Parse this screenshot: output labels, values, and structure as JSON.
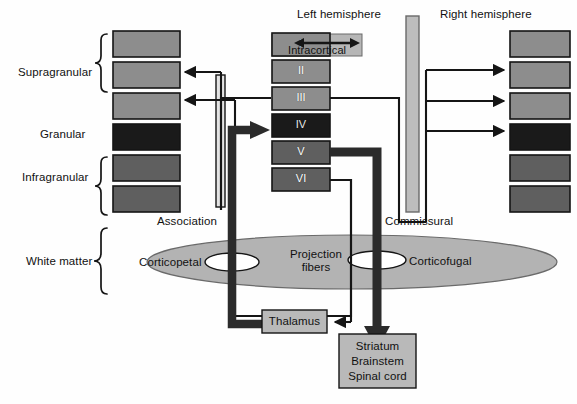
{
  "diagram": {
    "title_left": "Left hemisphere",
    "title_right": "Right hemisphere",
    "colors": {
      "block_light": "#8d8d8d",
      "block_mid": "#6e6e6e",
      "block_dark": "#1a1a1a",
      "intracortical_box": "#b6b6b6",
      "tract_bar": "#bdbdbd",
      "white_matter": "#b3b3b3",
      "node_box": "#b9b9b9",
      "stroke": "#151515",
      "background": "#ffffff"
    }
  },
  "side_labels": [
    {
      "label": "Supragranular"
    },
    {
      "label": "Granular"
    },
    {
      "label": "Infragranular"
    },
    {
      "label": "White matter"
    }
  ],
  "cortical_layers": [
    {
      "numeral": "I",
      "shade": "light"
    },
    {
      "numeral": "II",
      "shade": "light"
    },
    {
      "numeral": "III",
      "shade": "light"
    },
    {
      "numeral": "IV",
      "shade": "dark"
    },
    {
      "numeral": "V",
      "shade": "mid"
    },
    {
      "numeral": "VI",
      "shade": "mid"
    }
  ],
  "left_column_blocks": [
    {
      "shade": "light"
    },
    {
      "shade": "light"
    },
    {
      "shade": "light"
    },
    {
      "shade": "dark"
    },
    {
      "shade": "mid"
    },
    {
      "shade": "mid"
    }
  ],
  "right_column_blocks": [
    {
      "shade": "light"
    },
    {
      "shade": "light"
    },
    {
      "shade": "light"
    },
    {
      "shade": "dark"
    },
    {
      "shade": "mid"
    },
    {
      "shade": "mid"
    }
  ],
  "pathway_labels": {
    "intracortical": "Intracortical",
    "association": "Association",
    "commissural": "Commissural",
    "projection_fibers_line1": "Projection",
    "projection_fibers_line2": "fibers",
    "corticopetal": "Corticopetal",
    "corticofugal": "Corticofugal"
  },
  "nodes": {
    "thalamus": "Thalamus",
    "subcortical_line1": "Striatum",
    "subcortical_line2": "Brainstem",
    "subcortical_line3": "Spinal cord"
  }
}
